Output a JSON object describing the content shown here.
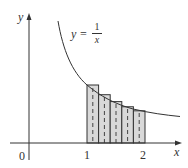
{
  "diagram": {
    "function_label": {
      "lhs": "y =",
      "numerator": "1",
      "denominator": "x"
    },
    "axes": {
      "x_label": "x",
      "y_label": "y",
      "origin_label": "0"
    },
    "x_ticks": [
      "1",
      "2"
    ],
    "rectangles": {
      "count": 5,
      "interval": [
        1,
        2
      ],
      "sample": "left",
      "heights": [
        1.0,
        0.8333,
        0.7143,
        0.625,
        0.5556
      ],
      "fill": "#d6d6d6",
      "stroke": "#333333"
    },
    "curve": {
      "x_range": [
        0.45,
        2.5
      ],
      "color": "#333333"
    },
    "colors": {
      "axis": "#333333",
      "background": "#ffffff"
    }
  }
}
